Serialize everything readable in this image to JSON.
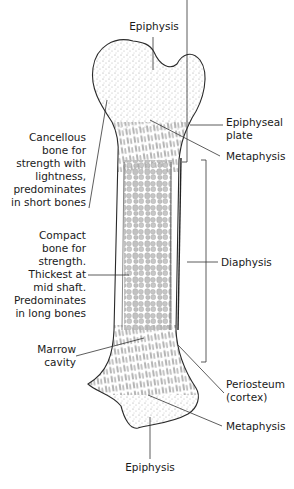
{
  "diagram": {
    "colors": {
      "outline": "#2a2a2a",
      "stipple": "#9a9a9a",
      "trabecula": "#b8b8b8",
      "marrow_cell": "#c4c4c4",
      "leader": "#333333",
      "text": "#1a1a1a"
    },
    "labels": {
      "epiphysis_top": "Epiphysis",
      "epiphyseal_plate": "Epiphyseal\nplate",
      "metaphysis_top": "Metaphysis",
      "cancellous": "Cancellous\nbone for\nstrength with\nlightness,\npredominates\nin short bones",
      "compact": "Compact\nbone for\nstrength.\nThickest at\nmid shaft.\nPredominates\nin long bones",
      "diaphysis": "Diaphysis",
      "marrow_cavity": "Marrow\ncavity",
      "periosteum": "Periosteum\n(cortex)",
      "metaphysis_bottom": "Metaphysis",
      "epiphysis_bottom": "Epiphysis"
    }
  }
}
